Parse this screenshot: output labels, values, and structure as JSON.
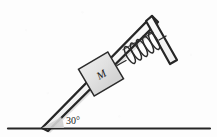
{
  "figure": {
    "background_color": "#fdfdfd",
    "ink_color": "#262626",
    "block_fill": "#e3e3e3",
    "incline_fill": "#f4f4f4",
    "wedge_fill": "#d8d8d8"
  },
  "labels": {
    "mass": "M",
    "angle": "30°"
  },
  "geometry": {
    "ground": {
      "x1": 8,
      "y1": 128,
      "x2": 210,
      "y2": 128
    },
    "incline": {
      "apex_x": 42,
      "apex_y": 128,
      "top_x": 152,
      "top_y": 16,
      "angle_degrees": 30
    },
    "wall": {
      "x1": 152,
      "y1": 16,
      "x2": 178,
      "y2": 62
    },
    "block": {
      "label": "M",
      "center_x": 101,
      "center_y": 74,
      "width": 34,
      "height": 30
    },
    "spring": {
      "coils": 5,
      "start_x": 118,
      "start_y": 64,
      "end_x": 163,
      "end_y": 38
    }
  },
  "annotations": {
    "angle_marker_radius": 22
  }
}
